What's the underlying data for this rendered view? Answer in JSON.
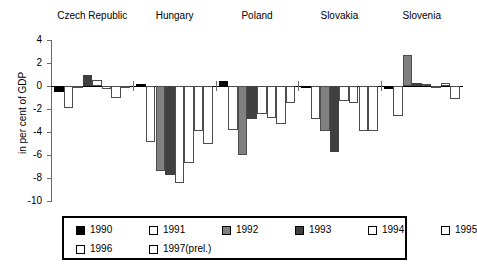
{
  "chart_data": {
    "type": "bar",
    "title": "",
    "xlabel": "",
    "ylabel": "in per cent of GDP",
    "ylim": [
      -10,
      4
    ],
    "yticks": [
      4,
      2,
      0,
      -2,
      -4,
      -6,
      -8,
      -10
    ],
    "ytick_labels": [
      "4",
      "2",
      "0",
      "-2",
      "-4",
      "-6",
      "-8",
      "-10"
    ],
    "grid": false,
    "legend_position": "bottom",
    "categories": [
      "Czech Republic",
      "Hungary",
      "Poland",
      "Slovakia",
      "Slovenia"
    ],
    "series": [
      {
        "name": "1990",
        "color": "#000000",
        "values": [
          -0.5,
          0.15,
          0.4,
          -0.2,
          -0.3
        ]
      },
      {
        "name": "1991",
        "color": "#ffffff",
        "values": [
          -1.9,
          -4.9,
          -3.8,
          -2.9,
          -2.6
        ]
      },
      {
        "name": "1992",
        "color": "#808080",
        "values": [
          -0.2,
          -7.4,
          -6.0,
          -3.9,
          2.7
        ]
      },
      {
        "name": "1993",
        "color": "#404040",
        "values": [
          1.0,
          -7.7,
          -2.9,
          -5.7,
          0.3
        ]
      },
      {
        "name": "1994",
        "color": "#ffffff",
        "values": [
          0.5,
          -8.4,
          -2.4,
          -1.3,
          0.2
        ]
      },
      {
        "name": "1995",
        "color": "#ffffff",
        "values": [
          -0.3,
          -6.7,
          -2.8,
          -1.5,
          -0.1
        ]
      },
      {
        "name": "1996",
        "color": "#ffffff",
        "values": [
          -1.0,
          -3.9,
          -3.3,
          -3.9,
          0.3
        ]
      },
      {
        "name": "1997(prel.)",
        "color": "#ffffff",
        "values": [
          -0.1,
          -5.0,
          -1.5,
          -3.9,
          -1.1
        ]
      }
    ]
  },
  "legend": {
    "items": [
      {
        "label": "1990",
        "color": "#000000"
      },
      {
        "label": "1991",
        "color": "#ffffff"
      },
      {
        "label": "1992",
        "color": "#808080"
      },
      {
        "label": "1993",
        "color": "#404040"
      },
      {
        "label": "1994",
        "color": "#ffffff"
      },
      {
        "label": "1995",
        "color": "#ffffff"
      },
      {
        "label": "1996",
        "color": "#ffffff"
      },
      {
        "label": "1997(prel.)",
        "color": "#ffffff"
      }
    ]
  }
}
